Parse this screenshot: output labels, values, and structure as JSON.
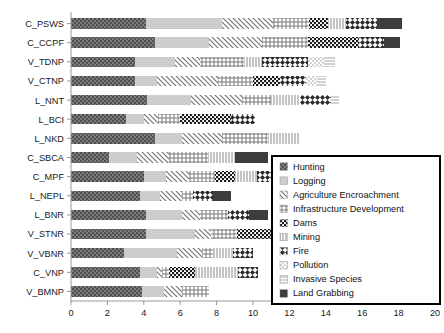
{
  "chart_data": {
    "type": "bar",
    "orientation": "horizontal",
    "stacked": true,
    "title": "",
    "xlabel": "",
    "ylabel": "",
    "xlim": [
      0,
      20
    ],
    "xticks": [
      0,
      2,
      4,
      6,
      8,
      10,
      12,
      14,
      16,
      18,
      20
    ],
    "grid": false,
    "legend_position": "inside-bottom-right",
    "categories": [
      "C_PSWS",
      "C_CCPF",
      "V_TDNP",
      "V_CTNP",
      "L_NNT",
      "L_BCI",
      "L_NKD",
      "C_SBCA",
      "C_MPF",
      "L_NEPL",
      "L_BNR",
      "V_STNR",
      "V_VBNR",
      "C_VNP",
      "V_BMNP"
    ],
    "series": [
      {
        "name": "Hunting",
        "pattern": "dense-dots",
        "values": [
          4.1,
          4.6,
          3.5,
          3.5,
          4.2,
          3.0,
          4.6,
          2.1,
          4.0,
          3.8,
          4.1,
          4.1,
          2.9,
          3.8,
          3.9
        ]
      },
      {
        "name": "Logging",
        "pattern": "light-gray",
        "values": [
          4.2,
          3.0,
          2.2,
          1.2,
          2.4,
          1.0,
          1.5,
          1.5,
          1.2,
          1.1,
          2.0,
          2.7,
          2.9,
          0.9,
          1.2
        ]
      },
      {
        "name": "Agriculture Encroachment",
        "pattern": "diagonal-hatch",
        "values": [
          2.8,
          2.9,
          1.4,
          3.4,
          2.8,
          0.8,
          2.2,
          1.8,
          1.3,
          1.2,
          1.0,
          0.9,
          1.4,
          0.3,
          1.0
        ]
      },
      {
        "name": "Infrastructure Development",
        "pattern": "cross-plus",
        "values": [
          2.0,
          2.5,
          2.4,
          1.9,
          1.6,
          1.2,
          2.5,
          2.1,
          1.4,
          0.6,
          1.5,
          1.4,
          0.6,
          0.4,
          1.5
        ]
      },
      {
        "name": "Dams",
        "pattern": "checker-dots",
        "values": [
          1.0,
          2.8,
          0.0,
          1.5,
          0.0,
          2.8,
          0.0,
          0.0,
          1.1,
          0.0,
          0.0,
          2.1,
          0.0,
          1.4,
          0.0
        ]
      },
      {
        "name": "Mining",
        "pattern": "vert-thin",
        "values": [
          1.0,
          0.0,
          1.0,
          0.0,
          1.6,
          0.0,
          1.7,
          1.5,
          1.2,
          0.0,
          0.0,
          1.6,
          1.1,
          2.4,
          0.0
        ]
      },
      {
        "name": "Fire",
        "pattern": "diamond-check",
        "values": [
          1.7,
          1.4,
          2.5,
          1.4,
          1.7,
          1.3,
          0.0,
          0.0,
          1.1,
          1.1,
          1.2,
          0.0,
          1.1,
          1.1,
          0.0
        ]
      },
      {
        "name": "Pollution",
        "pattern": "faint-check",
        "values": [
          0.0,
          0.0,
          0.9,
          0.6,
          0.0,
          0.0,
          0.0,
          0.0,
          0.0,
          0.0,
          0.0,
          0.7,
          0.0,
          0.0,
          0.0
        ]
      },
      {
        "name": "Invasive Species",
        "pattern": "horiz-lines",
        "values": [
          0.0,
          0.0,
          0.6,
          0.5,
          0.4,
          0.0,
          0.0,
          0.0,
          0.0,
          0.0,
          0.0,
          0.0,
          0.0,
          0.0,
          0.0
        ]
      },
      {
        "name": "Land Grabbing",
        "pattern": "solid-dark",
        "values": [
          1.4,
          0.9,
          0.0,
          0.0,
          0.0,
          0.0,
          0.0,
          1.8,
          0.9,
          1.0,
          1.0,
          0.0,
          0.0,
          0.0,
          0.0
        ]
      }
    ],
    "totals": [
      18.2,
      18.1,
      14.5,
      14.0,
      14.7,
      10.1,
      12.5,
      10.8,
      12.2,
      8.8,
      10.8,
      13.5,
      10.0,
      10.3,
      7.6
    ]
  },
  "legend": {
    "items": [
      {
        "label": "Hunting"
      },
      {
        "label": "Logging"
      },
      {
        "label": "Agriculture Encroachment"
      },
      {
        "label": "Infrastructure Development"
      },
      {
        "label": "Dams"
      },
      {
        "label": "Mining"
      },
      {
        "label": "Fire"
      },
      {
        "label": "Pollution"
      },
      {
        "label": "Invasive Species"
      },
      {
        "label": "Land Grabbing"
      }
    ]
  },
  "colors": {
    "axis": "#9a9a9a",
    "text": "#1a1a1a",
    "legend_border": "#000000",
    "dark": "#4a4a4a",
    "light": "#d8d8d8",
    "solid": "#3a3a3a",
    "background": "#ffffff"
  }
}
